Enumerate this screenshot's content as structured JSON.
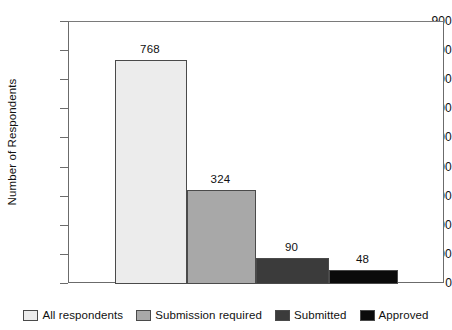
{
  "chart_data": {
    "type": "bar",
    "title": "",
    "xlabel": "",
    "ylabel": "Number of Respondents",
    "categories": [
      "All respondents",
      "Submission required",
      "Submitted",
      "Approved"
    ],
    "values": [
      768,
      324,
      90,
      48
    ],
    "value_labels": [
      "768",
      "324",
      "90",
      "48"
    ],
    "ylim": [
      0,
      900
    ],
    "ytick_values": [
      900,
      800,
      700,
      600,
      500,
      400,
      300,
      200,
      100,
      0
    ],
    "ytick_labels": [
      "900",
      "800",
      "700",
      "600",
      "500",
      "400",
      "300",
      "200",
      "100",
      "0"
    ],
    "grid": false,
    "legend_position": "bottom",
    "series_colors": [
      "#ececec",
      "#a8a8a8",
      "#3b3b3b",
      "#0b0b0b"
    ],
    "bar_border_color": "#4a4a4a",
    "axis_color": "#6b6b6b",
    "background_color": "#ffffff"
  },
  "legend": {
    "items": [
      {
        "label": "All respondents",
        "color": "#ececec"
      },
      {
        "label": "Submission required",
        "color": "#a8a8a8"
      },
      {
        "label": "Submitted",
        "color": "#3b3b3b"
      },
      {
        "label": "Approved",
        "color": "#0b0b0b"
      }
    ]
  }
}
